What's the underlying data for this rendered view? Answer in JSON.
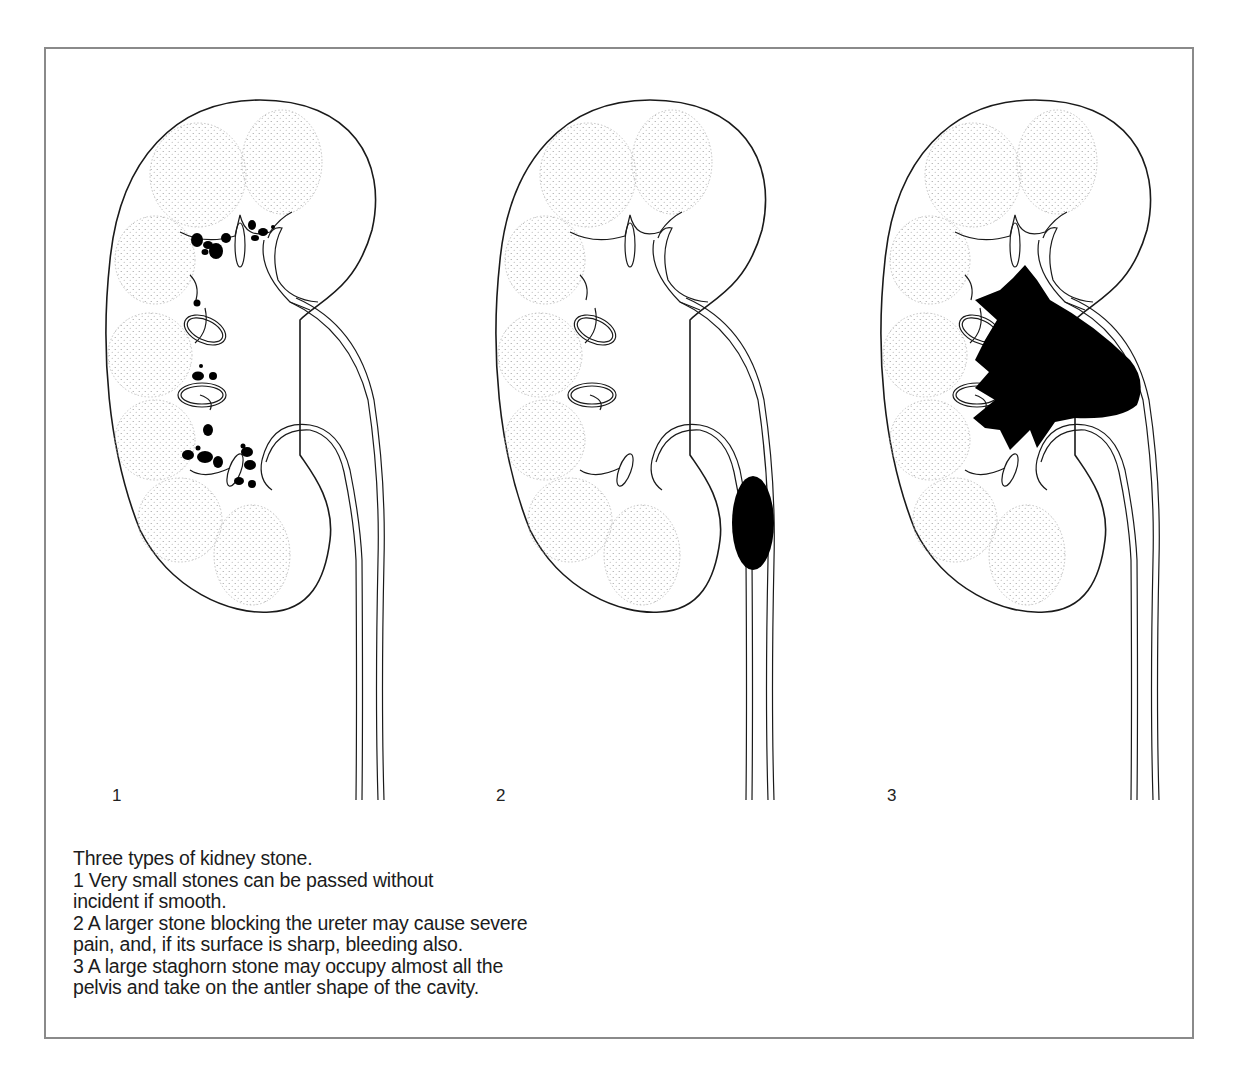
{
  "figure": {
    "panels": [
      {
        "number": "1",
        "stone_type": "multiple small stones in calyces"
      },
      {
        "number": "2",
        "stone_type": "single large stone blocking ureter"
      },
      {
        "number": "3",
        "stone_type": "staghorn stone filling pelvis"
      }
    ]
  },
  "caption": {
    "title": "Three types of kidney stone.",
    "lines": [
      "1  Very small stones can be passed without",
      "incident if smooth.",
      "2  A larger stone blocking the ureter may cause severe",
      "pain, and, if its surface is sharp, bleeding also.",
      "3  A large staghorn stone may occupy almost all the",
      "pelvis and take on the antler shape of the cavity."
    ]
  },
  "colors": {
    "frame": "#8a8a8a",
    "ink": "#1a1a1a",
    "stone": "#000000",
    "stipple": "#9a9a9a"
  }
}
